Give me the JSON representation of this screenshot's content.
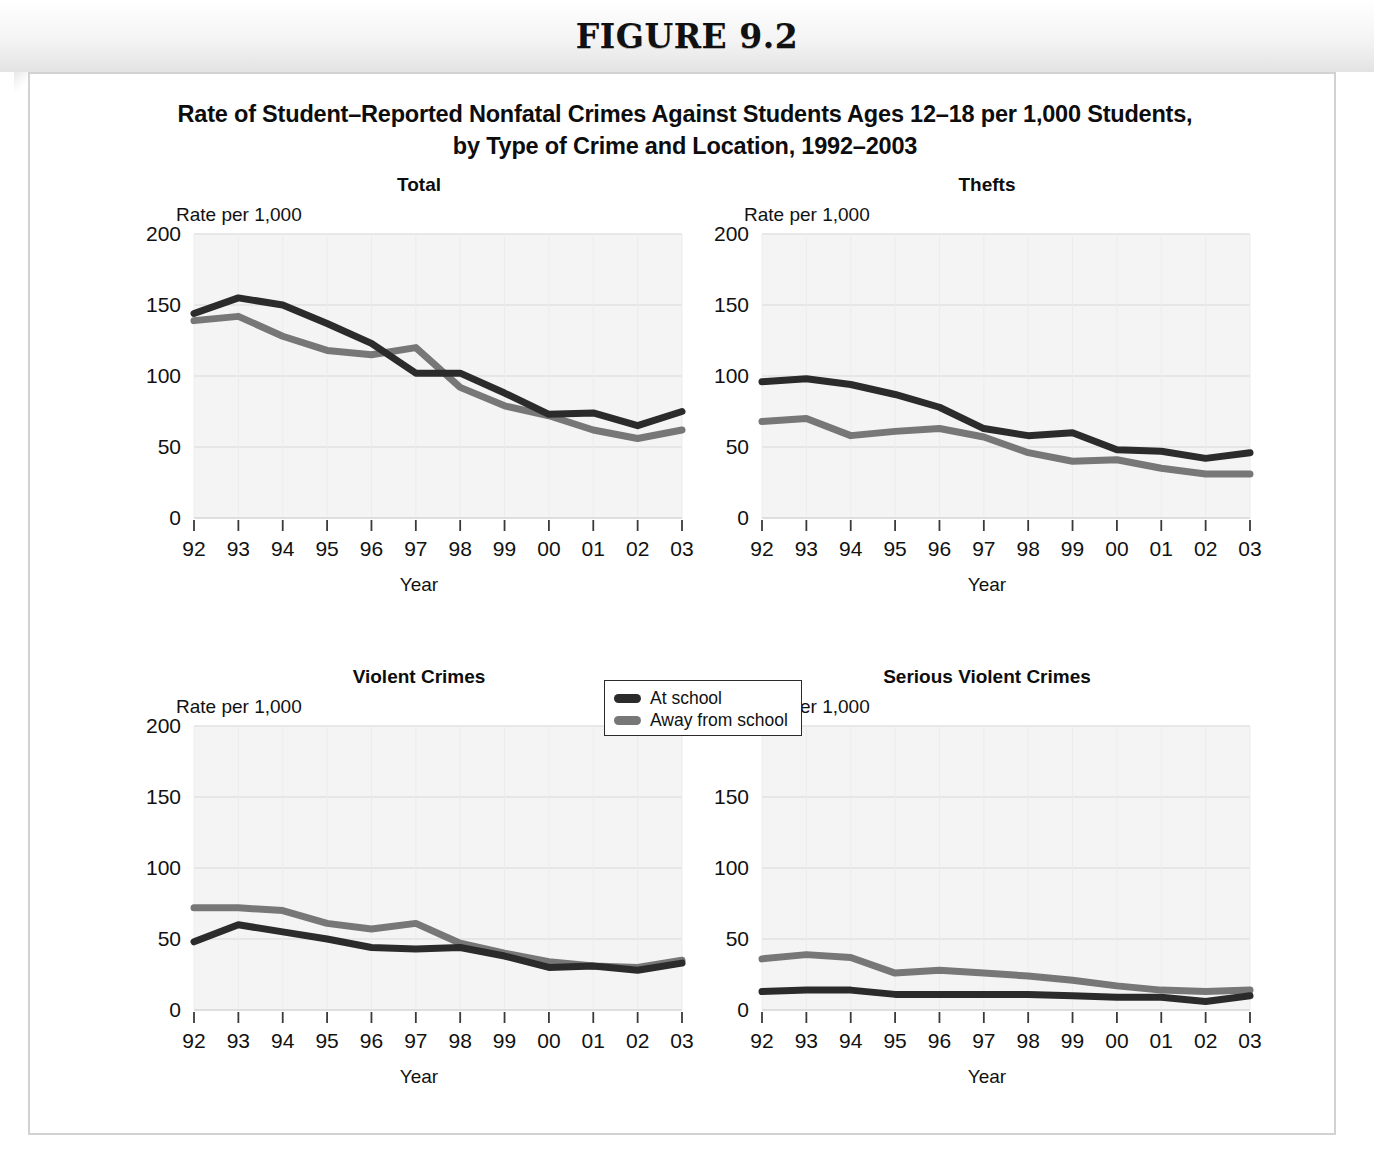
{
  "figure": {
    "number_label": "FIGURE 9.2",
    "title_line1": "Rate of Student–Reported Nonfatal Crimes Against Students Ages 12–18 per 1,000 Students,",
    "title_line2": "by Type of Crime and Location, 1992–2003"
  },
  "legend": {
    "items": [
      {
        "label": "At school",
        "color": "#2b2b2b",
        "swatch_name": "legend-swatch-at-school"
      },
      {
        "label": "Away from school",
        "color": "#777777",
        "swatch_name": "legend-swatch-away-from-school"
      }
    ]
  },
  "colors": {
    "at_school": "#2b2b2b",
    "away_from_school": "#777777",
    "plot_background": "#f4f4f4",
    "gridline": "#e2e2e2",
    "axis": "#3a3a3a",
    "card_border": "#d2d2d2"
  },
  "axes": {
    "y_label": "Rate per 1,000",
    "x_label": "Year",
    "y_ticks": [
      0,
      50,
      100,
      150,
      200
    ],
    "y_min": 0,
    "y_max": 200,
    "x_tick_labels": [
      "92",
      "93",
      "94",
      "95",
      "96",
      "97",
      "98",
      "99",
      "00",
      "01",
      "02",
      "03"
    ]
  },
  "chart_data": [
    {
      "type": "line",
      "title": "Total",
      "xlabel": "Year",
      "ylabel": "Rate per 1,000",
      "ylim": [
        0,
        200
      ],
      "grid": true,
      "legend_position": "below-center",
      "categories": [
        "92",
        "93",
        "94",
        "95",
        "96",
        "97",
        "98",
        "99",
        "00",
        "01",
        "02",
        "03"
      ],
      "series": [
        {
          "name": "At school",
          "color": "#2b2b2b",
          "values": [
            144,
            155,
            150,
            137,
            123,
            102,
            102,
            88,
            73,
            74,
            65,
            75
          ]
        },
        {
          "name": "Away from school",
          "color": "#777777",
          "values": [
            139,
            142,
            128,
            118,
            115,
            120,
            92,
            79,
            72,
            62,
            56,
            62
          ]
        }
      ]
    },
    {
      "type": "line",
      "title": "Thefts",
      "xlabel": "Year",
      "ylabel": "Rate per 1,000",
      "ylim": [
        0,
        200
      ],
      "grid": true,
      "legend_position": "below-center",
      "categories": [
        "92",
        "93",
        "94",
        "95",
        "96",
        "97",
        "98",
        "99",
        "00",
        "01",
        "02",
        "03"
      ],
      "series": [
        {
          "name": "At school",
          "color": "#2b2b2b",
          "values": [
            96,
            98,
            94,
            87,
            78,
            63,
            58,
            60,
            48,
            47,
            42,
            46
          ]
        },
        {
          "name": "Away from school",
          "color": "#777777",
          "values": [
            68,
            70,
            58,
            61,
            63,
            57,
            46,
            40,
            41,
            35,
            31,
            31
          ]
        }
      ]
    },
    {
      "type": "line",
      "title": "Violent Crimes",
      "xlabel": "Year",
      "ylabel": "Rate per 1,000",
      "ylim": [
        0,
        200
      ],
      "grid": true,
      "legend_position": "below-center",
      "categories": [
        "92",
        "93",
        "94",
        "95",
        "96",
        "97",
        "98",
        "99",
        "00",
        "01",
        "02",
        "03"
      ],
      "series": [
        {
          "name": "At school",
          "color": "#2b2b2b",
          "values": [
            48,
            60,
            55,
            50,
            44,
            43,
            44,
            38,
            30,
            31,
            28,
            33
          ]
        },
        {
          "name": "Away from school",
          "color": "#777777",
          "values": [
            72,
            72,
            70,
            61,
            57,
            61,
            47,
            40,
            34,
            31,
            30,
            35
          ]
        }
      ]
    },
    {
      "type": "line",
      "title": "Serious Violent Crimes",
      "xlabel": "Year",
      "ylabel": "Rate per 1,000",
      "ylim": [
        0,
        200
      ],
      "grid": true,
      "legend_position": "below-center",
      "categories": [
        "92",
        "93",
        "94",
        "95",
        "96",
        "97",
        "98",
        "99",
        "00",
        "01",
        "02",
        "03"
      ],
      "series": [
        {
          "name": "At school",
          "color": "#2b2b2b",
          "values": [
            13,
            14,
            14,
            11,
            11,
            11,
            11,
            10,
            9,
            9,
            6,
            10
          ]
        },
        {
          "name": "Away from school",
          "color": "#777777",
          "values": [
            36,
            39,
            37,
            26,
            28,
            26,
            24,
            21,
            17,
            14,
            13,
            14
          ]
        }
      ]
    }
  ]
}
